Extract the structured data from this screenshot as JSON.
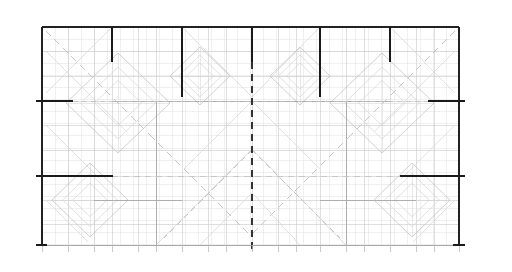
{
  "document": {
    "title": "Architectural Floor Plan",
    "drawing_type": "cad-technical-drawing",
    "canvas": {
      "width": 512,
      "height": 272,
      "background": "#ffffff"
    }
  },
  "styles": {
    "heavy_line_color": "#1a1a1a",
    "boundary_color": "#222222",
    "grid_color": "#c9c9c9",
    "grid_minor_color": "#e2e2e2",
    "pattern_color": "#bdbdbd",
    "pattern_light_color": "#d4d4d4",
    "centerline_color": "#333333",
    "dashed_guide_color": "#c0c0c0",
    "heavy_line_width": 2.2,
    "boundary_line_width": 2.2,
    "grid_line_width": 0.6,
    "pattern_line_width": 0.7
  },
  "plan": {
    "bounds": {
      "left": 42,
      "top": 27,
      "right": 459,
      "bottom": 245
    },
    "grid": {
      "vertical_spacing": 26.1,
      "horizontal_spacing": 24.2,
      "vertical_columns": [
        42,
        68,
        94,
        112,
        138,
        156,
        182,
        208,
        226,
        252,
        278,
        296,
        320,
        346,
        364,
        390,
        416,
        434,
        459
      ],
      "horizontal_rows": [
        27,
        51,
        76,
        101,
        125,
        150,
        176,
        200,
        224,
        245
      ]
    },
    "boundary_edges": [
      {
        "name": "top-edge",
        "x1": 42,
        "y1": 27,
        "x2": 459,
        "y2": 27,
        "weight": "heavy"
      },
      {
        "name": "left-edge",
        "x1": 42,
        "y1": 27,
        "x2": 42,
        "y2": 245,
        "weight": "heavy"
      },
      {
        "name": "right-edge",
        "x1": 459,
        "y1": 27,
        "x2": 459,
        "y2": 245,
        "weight": "heavy"
      },
      {
        "name": "bottom-edge",
        "x1": 42,
        "y1": 245,
        "x2": 459,
        "y2": 245,
        "weight": "light"
      }
    ]
  },
  "section_marks": {
    "top_vertical": [
      {
        "label": "mark-1",
        "x": 112,
        "y1": 27,
        "y2": 62
      },
      {
        "label": "mark-2",
        "x": 182,
        "y1": 27,
        "y2": 97
      },
      {
        "label": "mark-3",
        "x": 252,
        "y1": 27,
        "y2": 62
      },
      {
        "label": "mark-4",
        "x": 320,
        "y1": 27,
        "y2": 97
      },
      {
        "label": "mark-5",
        "x": 390,
        "y1": 27,
        "y2": 62
      }
    ],
    "left_horizontal": [
      {
        "label": "mark-l1",
        "y": 101,
        "x1": 36,
        "x2": 73
      },
      {
        "label": "mark-l2",
        "y": 176,
        "x1": 36,
        "x2": 113
      }
    ],
    "right_horizontal": [
      {
        "label": "mark-r1",
        "y": 101,
        "x1": 428,
        "x2": 465
      },
      {
        "label": "mark-r2",
        "y": 176,
        "x1": 400,
        "x2": 465
      }
    ],
    "bottom_corner_ticks": [
      {
        "label": "bottom-left-tick",
        "x1": 36,
        "y1": 245,
        "x2": 47,
        "y2": 245
      },
      {
        "label": "bottom-right-tick",
        "x1": 453,
        "y1": 245,
        "x2": 465,
        "y2": 245
      }
    ]
  },
  "centerlines": [
    {
      "name": "vertical-centerline",
      "x1": 252,
      "y1": 62,
      "x2": 252,
      "y2": 252,
      "orientation": "vertical",
      "dash": "7,5"
    },
    {
      "name": "horizontal-centerline",
      "x1": 46,
      "y1": 176,
      "x2": 455,
      "y2": 176,
      "orientation": "horizontal",
      "dash": "6,5"
    },
    {
      "name": "horizontal-guide-upper",
      "x1": 46,
      "y1": 101,
      "x2": 455,
      "y2": 101,
      "orientation": "horizontal",
      "dash": "5,4"
    }
  ],
  "diagonal_guides": [
    {
      "name": "guide-tl",
      "x1": 46,
      "y1": 31,
      "x2": 150,
      "y2": 135,
      "dash": "7,5"
    },
    {
      "name": "guide-tr",
      "x1": 455,
      "y1": 31,
      "x2": 351,
      "y2": 135,
      "dash": "7,5"
    },
    {
      "name": "guide-bl",
      "x1": 150,
      "y1": 135,
      "x2": 252,
      "y2": 237,
      "dash": "7,5"
    },
    {
      "name": "guide-br",
      "x1": 351,
      "y1": 135,
      "x2": 252,
      "y2": 234,
      "dash": "7,5"
    },
    {
      "name": "guide-center-x1",
      "x1": 252,
      "y1": 150,
      "x2": 340,
      "y2": 238,
      "dash": "6,4"
    },
    {
      "name": "guide-center-x2",
      "x1": 252,
      "y1": 150,
      "x2": 164,
      "y2": 238,
      "dash": "6,4"
    }
  ],
  "diamond_modules": [
    {
      "name": "diamond-tl",
      "cx": 118,
      "cy": 103,
      "rx": 52,
      "ry": 50
    },
    {
      "name": "diamond-tr",
      "cx": 382,
      "cy": 103,
      "rx": 52,
      "ry": 50
    },
    {
      "name": "diamond-bl",
      "cx": 90,
      "cy": 200,
      "rx": 38,
      "ry": 37
    },
    {
      "name": "diamond-br",
      "cx": 412,
      "cy": 200,
      "rx": 38,
      "ry": 37
    },
    {
      "name": "diamond-tc-left",
      "cx": 200,
      "cy": 76,
      "rx": 30,
      "ry": 29
    },
    {
      "name": "diamond-tc-right",
      "cx": 300,
      "cy": 76,
      "rx": 30,
      "ry": 29
    }
  ],
  "inner_partitions": [
    {
      "name": "partition-upper",
      "x1": 112,
      "y1": 101,
      "x2": 390,
      "y2": 101
    },
    {
      "name": "partition-lower-left",
      "x1": 94,
      "y1": 200,
      "x2": 182,
      "y2": 200
    },
    {
      "name": "partition-lower-right",
      "x1": 320,
      "y1": 200,
      "x2": 416,
      "y2": 200
    },
    {
      "name": "partition-vertical-left",
      "x1": 156,
      "y1": 101,
      "x2": 156,
      "y2": 245
    },
    {
      "name": "partition-vertical-right",
      "x1": 346,
      "y1": 101,
      "x2": 346,
      "y2": 245
    }
  ],
  "bottom_ticks": {
    "y_top": 245,
    "y_bottom": 252,
    "positions": [
      42,
      68,
      94,
      112,
      138,
      156,
      182,
      208,
      226,
      252,
      278,
      296,
      320,
      346,
      364,
      390,
      416,
      434,
      459
    ]
  }
}
